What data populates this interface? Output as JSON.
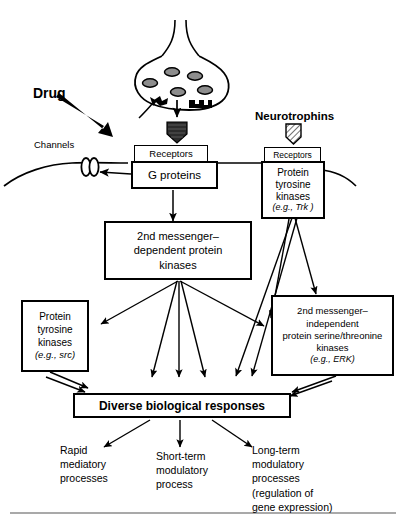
{
  "figure": {
    "type": "diagram",
    "width": 404,
    "height": 528,
    "background": "#ffffff",
    "ink_color": "#000000"
  },
  "labels": {
    "drug": "Drug",
    "neurotrophins": "Neurotrophins",
    "channels": "Channels",
    "receptors_left": "Receptors",
    "receptors_right": "Receptors"
  },
  "boxes": {
    "g_proteins": {
      "text": "G proteins"
    },
    "ptk_trk": {
      "line1": "Protein",
      "line2": "tyrosine",
      "line3": "kinases",
      "line4": "(e.g., Trk )",
      "italic_example": "Trk"
    },
    "second_messenger_dependent": {
      "line1": "2nd messenger–",
      "line2": "dependent protein",
      "line3": "kinases"
    },
    "ptk_src": {
      "line1": "Protein",
      "line2": "tyrosine",
      "line3": "kinases",
      "line4": "(e.g., src)",
      "italic_example": "src"
    },
    "second_messenger_independent": {
      "line1": "2nd messenger–",
      "line2": "independent",
      "line3": "protein serine/threonine",
      "line4": "kinases",
      "line5": "(e.g., ERK)",
      "italic_example": "ERK"
    },
    "responses": {
      "text": "Diverse biological responses"
    }
  },
  "outcomes": [
    {
      "id": "rapid",
      "lines": "Rapid\nmediatory\nprocesses"
    },
    {
      "id": "short-term",
      "lines": "Short-term\nmodulatory\nprocess"
    },
    {
      "id": "long-term",
      "lines": "Long-term\nmodulatory\nprocesses\n(regulation of\ngene expression)"
    }
  ],
  "glyphs": {
    "presynaptic_terminal": "nerve-terminal-with-vesicles",
    "drug_ligand": "filled-shield-ligand",
    "neurotrophin_ligand": "hatched-shield-ligand",
    "ion_channel": "double-oval-channel",
    "membrane": "curved-plasma-membrane"
  }
}
